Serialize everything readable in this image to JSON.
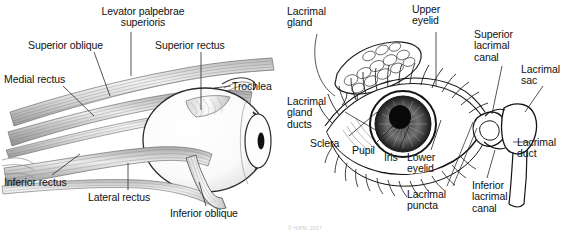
{
  "figure": {
    "background_color": "#ffffff",
    "ink_color": "#111111",
    "muscle_tone_color": "#8a8a8a",
    "panels": [
      {
        "id": "left",
        "name": "extraocular-muscles-diagram",
        "description": "Lateral view of the right eye showing the extraocular muscles",
        "labels": [
          {
            "key": "levator",
            "text": "Levator palpebrae\nsuperioris",
            "x": 88,
            "y": 6,
            "align": "center",
            "width": 110
          },
          {
            "key": "superior_oblique",
            "text": "Superior oblique",
            "x": 28,
            "y": 40,
            "align": "left",
            "width": 104
          },
          {
            "key": "superior_rectus",
            "text": "Superior rectus",
            "x": 155,
            "y": 40,
            "align": "left",
            "width": 98
          },
          {
            "key": "medial_rectus",
            "text": "Medial rectus",
            "x": 4,
            "y": 74,
            "align": "left",
            "width": 86
          },
          {
            "key": "trochlea",
            "text": "Trochlea",
            "x": 232,
            "y": 81,
            "align": "left",
            "width": 52
          },
          {
            "key": "inferior_rectus",
            "text": "Inferior rectus",
            "x": 4,
            "y": 177,
            "align": "left",
            "width": 84
          },
          {
            "key": "lateral_rectus",
            "text": "Lateral rectus",
            "x": 88,
            "y": 192,
            "align": "left",
            "width": 86
          },
          {
            "key": "inferior_oblique",
            "text": "Inferior oblique",
            "x": 170,
            "y": 208,
            "align": "left",
            "width": 90
          }
        ]
      },
      {
        "id": "right",
        "name": "lacrimal-apparatus-diagram",
        "description": "Anterior view of the right eye showing the lacrimal apparatus",
        "labels": [
          {
            "key": "lacrimal_gland_top",
            "text": "Lacrimal\ngland",
            "x": 6,
            "y": 6,
            "align": "left",
            "width": 58
          },
          {
            "key": "upper_eyelid",
            "text": "Upper\neyelid",
            "x": 131,
            "y": 4,
            "align": "left",
            "width": 48
          },
          {
            "key": "superior_lacrimal",
            "text": "Superior\nlacrimal\ncanal",
            "x": 193,
            "y": 29,
            "align": "left",
            "width": 58
          },
          {
            "key": "lacrimal_sac",
            "text": "Lacrimal\nsac",
            "x": 240,
            "y": 64,
            "align": "left",
            "width": 56
          },
          {
            "key": "lacrimal_gland_ducts",
            "text": "Lacrimal\ngland\nducts",
            "x": 6,
            "y": 96,
            "align": "left",
            "width": 58
          },
          {
            "key": "sclera",
            "text": "Sclera",
            "x": 29,
            "y": 138,
            "align": "left",
            "width": 44
          },
          {
            "key": "pupil",
            "text": "Pupil",
            "x": 71,
            "y": 145,
            "align": "left",
            "width": 36
          },
          {
            "key": "iris",
            "text": "Iris",
            "x": 103,
            "y": 152,
            "align": "left",
            "width": 26
          },
          {
            "key": "lower_eyelid",
            "text": "Lower\neyelid",
            "x": 126,
            "y": 152,
            "align": "left",
            "width": 48
          },
          {
            "key": "lacrimal_duct",
            "text": "Lacrimal\nduct",
            "x": 236,
            "y": 137,
            "align": "left",
            "width": 56
          },
          {
            "key": "lacrimal_puncta",
            "text": "Lacrimal\npuncta",
            "x": 126,
            "y": 189,
            "align": "left",
            "width": 58
          },
          {
            "key": "inferior_lacrimal",
            "text": "Inferior\nlacrimal\ncanal",
            "x": 191,
            "y": 180,
            "align": "left",
            "width": 56
          }
        ]
      }
    ],
    "copyright": {
      "text": "© HIPM, 2017",
      "x": 288,
      "y": 225
    }
  }
}
